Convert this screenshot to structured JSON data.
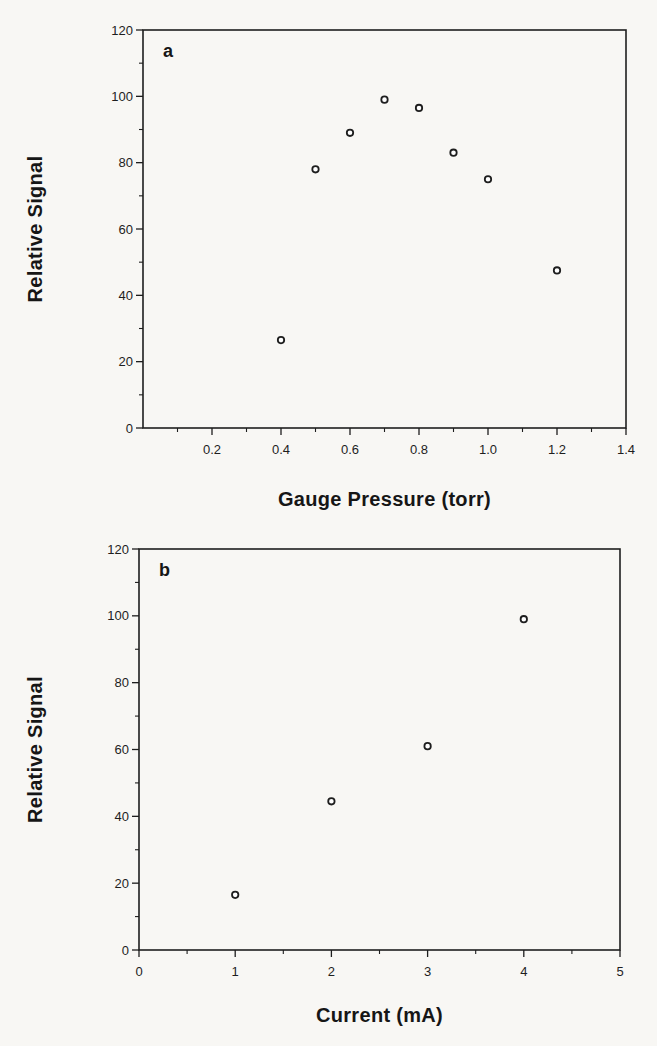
{
  "figure": {
    "background": "#f8f7f4",
    "ink": "#1e1e1e",
    "marker_fill": "#ffffff"
  },
  "chart_data": [
    {
      "id": "panel-a",
      "type": "scatter",
      "panel_label": "a",
      "xlabel": "Gauge Pressure (torr)",
      "ylabel": "Relative Signal",
      "xlim": [
        0,
        1.4
      ],
      "ylim": [
        0,
        120
      ],
      "x_major_ticks": [
        0.2,
        0.4,
        0.6,
        0.8,
        1.0,
        1.2,
        1.4
      ],
      "x_tick_labels": [
        "0.2",
        "0.4",
        "0.6",
        "0.8",
        "1.0",
        "1.2",
        "1.4"
      ],
      "x_minor_step": 0.1,
      "y_major_ticks": [
        0,
        20,
        40,
        60,
        80,
        100,
        120
      ],
      "y_tick_labels": [
        "0",
        "20",
        "40",
        "60",
        "80",
        "100",
        "120"
      ],
      "y_minor_step": 10,
      "grid": false,
      "legend": false,
      "marker": "open-circle",
      "points": [
        {
          "x": 0.4,
          "y": 26.5
        },
        {
          "x": 0.5,
          "y": 78
        },
        {
          "x": 0.6,
          "y": 89
        },
        {
          "x": 0.7,
          "y": 99
        },
        {
          "x": 0.8,
          "y": 96.5
        },
        {
          "x": 0.9,
          "y": 83
        },
        {
          "x": 1.0,
          "y": 75
        },
        {
          "x": 1.2,
          "y": 47.5
        }
      ]
    },
    {
      "id": "panel-b",
      "type": "scatter",
      "panel_label": "b",
      "xlabel": "Current (mA)",
      "ylabel": "Relative Signal",
      "xlim": [
        0,
        5
      ],
      "ylim": [
        0,
        120
      ],
      "x_major_ticks": [
        0,
        1,
        2,
        3,
        4,
        5
      ],
      "x_tick_labels": [
        "0",
        "1",
        "2",
        "3",
        "4",
        "5"
      ],
      "x_minor_step": 0.5,
      "y_major_ticks": [
        0,
        20,
        40,
        60,
        80,
        100,
        120
      ],
      "y_tick_labels": [
        "0",
        "20",
        "40",
        "60",
        "80",
        "100",
        "120"
      ],
      "y_minor_step": 10,
      "grid": false,
      "legend": false,
      "marker": "open-circle",
      "points": [
        {
          "x": 1,
          "y": 16.5
        },
        {
          "x": 2,
          "y": 44.5
        },
        {
          "x": 3,
          "y": 61
        },
        {
          "x": 4,
          "y": 99
        }
      ]
    }
  ]
}
